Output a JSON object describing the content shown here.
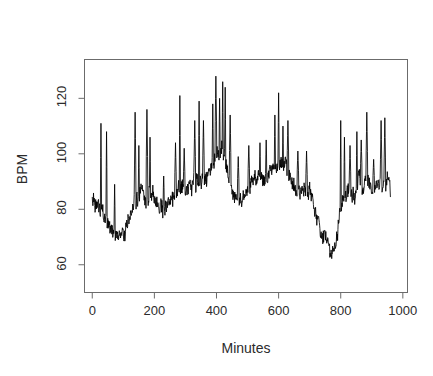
{
  "figure": {
    "panel_label": "(b)",
    "background_color": "#ffffff",
    "line_color": "#000000",
    "axis_color": "#6b6b6b",
    "text_color": "#2b2b2b"
  },
  "chart_data": {
    "type": "line",
    "title": "Husband",
    "xlabel": "Minutes",
    "ylabel": "BPM",
    "xlim": [
      -25,
      1015
    ],
    "ylim": [
      50,
      134
    ],
    "grid": false,
    "legend": null,
    "xticks": [
      0,
      200,
      400,
      600,
      800,
      1000
    ],
    "xtick_labels": [
      "0",
      "200",
      "400",
      "600",
      "800",
      "1000"
    ],
    "yticks": [
      60,
      80,
      100,
      120
    ],
    "ytick_labels": [
      "60",
      "80",
      "100",
      "120"
    ],
    "series_name": "heart rate",
    "x_start": 0,
    "x_end": 960,
    "n_points": 961,
    "value_range": [
      61,
      128
    ],
    "baseline_profile": [
      {
        "minute": 0,
        "bpm": 85
      },
      {
        "minute": 20,
        "bpm": 83
      },
      {
        "minute": 40,
        "bpm": 80
      },
      {
        "minute": 60,
        "bpm": 73
      },
      {
        "minute": 80,
        "bpm": 69
      },
      {
        "minute": 100,
        "bpm": 70
      },
      {
        "minute": 120,
        "bpm": 76
      },
      {
        "minute": 140,
        "bpm": 82
      },
      {
        "minute": 160,
        "bpm": 86
      },
      {
        "minute": 180,
        "bpm": 86
      },
      {
        "minute": 200,
        "bpm": 85
      },
      {
        "minute": 220,
        "bpm": 83
      },
      {
        "minute": 240,
        "bpm": 82
      },
      {
        "minute": 260,
        "bpm": 84
      },
      {
        "minute": 280,
        "bpm": 87
      },
      {
        "minute": 300,
        "bpm": 87
      },
      {
        "minute": 320,
        "bpm": 88
      },
      {
        "minute": 340,
        "bpm": 90
      },
      {
        "minute": 360,
        "bpm": 90
      },
      {
        "minute": 380,
        "bpm": 95
      },
      {
        "minute": 400,
        "bpm": 100
      },
      {
        "minute": 420,
        "bpm": 100
      },
      {
        "minute": 440,
        "bpm": 92
      },
      {
        "minute": 460,
        "bpm": 86
      },
      {
        "minute": 480,
        "bpm": 84
      },
      {
        "minute": 500,
        "bpm": 88
      },
      {
        "minute": 520,
        "bpm": 90
      },
      {
        "minute": 540,
        "bpm": 92
      },
      {
        "minute": 560,
        "bpm": 93
      },
      {
        "minute": 580,
        "bpm": 95
      },
      {
        "minute": 600,
        "bpm": 97
      },
      {
        "minute": 620,
        "bpm": 95
      },
      {
        "minute": 640,
        "bpm": 90
      },
      {
        "minute": 660,
        "bpm": 89
      },
      {
        "minute": 680,
        "bpm": 88
      },
      {
        "minute": 700,
        "bpm": 85
      },
      {
        "minute": 720,
        "bpm": 78
      },
      {
        "minute": 740,
        "bpm": 72
      },
      {
        "minute": 760,
        "bpm": 67
      },
      {
        "minute": 780,
        "bpm": 65
      },
      {
        "minute": 800,
        "bpm": 80
      },
      {
        "minute": 820,
        "bpm": 88
      },
      {
        "minute": 840,
        "bpm": 85
      },
      {
        "minute": 860,
        "bpm": 90
      },
      {
        "minute": 880,
        "bpm": 91
      },
      {
        "minute": 900,
        "bpm": 88
      },
      {
        "minute": 920,
        "bpm": 87
      },
      {
        "minute": 940,
        "bpm": 88
      },
      {
        "minute": 960,
        "bpm": 88
      }
    ],
    "spike_peaks": [
      {
        "minute": 28,
        "bpm": 111
      },
      {
        "minute": 46,
        "bpm": 108
      },
      {
        "minute": 72,
        "bpm": 89
      },
      {
        "minute": 138,
        "bpm": 115
      },
      {
        "minute": 150,
        "bpm": 103
      },
      {
        "minute": 176,
        "bpm": 116
      },
      {
        "minute": 186,
        "bpm": 106
      },
      {
        "minute": 230,
        "bpm": 92
      },
      {
        "minute": 268,
        "bpm": 104
      },
      {
        "minute": 282,
        "bpm": 121
      },
      {
        "minute": 296,
        "bpm": 102
      },
      {
        "minute": 330,
        "bpm": 112
      },
      {
        "minute": 344,
        "bpm": 119
      },
      {
        "minute": 358,
        "bpm": 112
      },
      {
        "minute": 388,
        "bpm": 118
      },
      {
        "minute": 398,
        "bpm": 128
      },
      {
        "minute": 410,
        "bpm": 120
      },
      {
        "minute": 420,
        "bpm": 126
      },
      {
        "minute": 428,
        "bpm": 124
      },
      {
        "minute": 444,
        "bpm": 114
      },
      {
        "minute": 470,
        "bpm": 99
      },
      {
        "minute": 504,
        "bpm": 103
      },
      {
        "minute": 540,
        "bpm": 104
      },
      {
        "minute": 560,
        "bpm": 105
      },
      {
        "minute": 588,
        "bpm": 114
      },
      {
        "minute": 600,
        "bpm": 122
      },
      {
        "minute": 614,
        "bpm": 110
      },
      {
        "minute": 630,
        "bpm": 112
      },
      {
        "minute": 662,
        "bpm": 101
      },
      {
        "minute": 690,
        "bpm": 101
      },
      {
        "minute": 800,
        "bpm": 112
      },
      {
        "minute": 812,
        "bpm": 106
      },
      {
        "minute": 830,
        "bpm": 103
      },
      {
        "minute": 852,
        "bpm": 108
      },
      {
        "minute": 866,
        "bpm": 105
      },
      {
        "minute": 884,
        "bpm": 115
      },
      {
        "minute": 906,
        "bpm": 98
      },
      {
        "minute": 930,
        "bpm": 112
      },
      {
        "minute": 942,
        "bpm": 113
      }
    ]
  }
}
